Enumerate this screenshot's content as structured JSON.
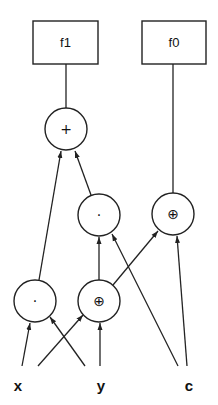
{
  "diagram": {
    "type": "expression-dag",
    "outputs": [
      {
        "id": "f1",
        "label": "f1"
      },
      {
        "id": "f0",
        "label": "f0"
      }
    ],
    "operators": [
      {
        "id": "add_top",
        "symbol": "+",
        "name": "add"
      },
      {
        "id": "and_mid",
        "symbol": "·",
        "name": "and"
      },
      {
        "id": "xor_right",
        "symbol": "⊕",
        "name": "xor"
      },
      {
        "id": "and_low",
        "symbol": "·",
        "name": "and"
      },
      {
        "id": "xor_low",
        "symbol": "⊕",
        "name": "xor"
      }
    ],
    "inputs": [
      {
        "id": "x",
        "label": "x"
      },
      {
        "id": "y",
        "label": "y"
      },
      {
        "id": "c",
        "label": "c"
      }
    ],
    "edges": [
      {
        "from": "add_top",
        "to": "f1"
      },
      {
        "from": "xor_right",
        "to": "f0"
      },
      {
        "from": "and_low",
        "to": "add_top"
      },
      {
        "from": "and_mid",
        "to": "add_top"
      },
      {
        "from": "xor_low",
        "to": "and_mid"
      },
      {
        "from": "c",
        "to": "and_mid"
      },
      {
        "from": "xor_low",
        "to": "xor_right"
      },
      {
        "from": "c",
        "to": "xor_right"
      },
      {
        "from": "x",
        "to": "and_low"
      },
      {
        "from": "y",
        "to": "and_low"
      },
      {
        "from": "x",
        "to": "xor_low"
      },
      {
        "from": "y",
        "to": "xor_low"
      }
    ]
  }
}
